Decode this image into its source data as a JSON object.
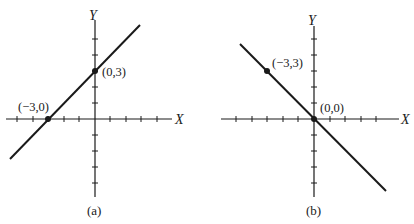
{
  "figures": [
    {
      "id": "a",
      "caption": "(a)",
      "x_axis_label": "X",
      "y_axis_label": "Y",
      "points": [
        {
          "label": "(−3,0)",
          "x": -3,
          "y": 0
        },
        {
          "label": "(0,3)",
          "x": 0,
          "y": 3
        }
      ],
      "line": {
        "slope": 1,
        "intercept": 3,
        "equation": "y = x + 3"
      }
    },
    {
      "id": "b",
      "caption": "(b)",
      "x_axis_label": "X",
      "y_axis_label": "Y",
      "points": [
        {
          "label": "(−3,3)",
          "x": -3,
          "y": 3
        },
        {
          "label": "(0,0)",
          "x": 0,
          "y": 0
        }
      ],
      "line": {
        "slope": -1,
        "intercept": 0,
        "equation": "y = -x"
      }
    }
  ],
  "colors": {
    "ink": "#1a1a1a",
    "background": "#ffffff"
  }
}
